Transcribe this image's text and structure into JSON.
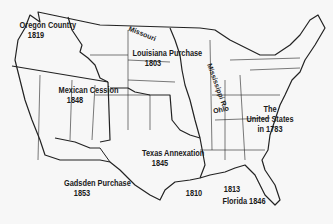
{
  "map": {
    "title": "U.S. Territorial Expansion",
    "regions": [
      {
        "id": "oregon",
        "name": "Oregon Country",
        "year": "1819"
      },
      {
        "id": "louisiana",
        "name": "Louisiana Purchase",
        "year": "1803"
      },
      {
        "id": "mexican",
        "name": "Mexican Cession",
        "year": "1848"
      },
      {
        "id": "texas",
        "name": "Texas Annexation",
        "year": "1845"
      },
      {
        "id": "gadsden",
        "name": "Gadsden Purchase",
        "year": "1853"
      },
      {
        "id": "us1783",
        "name_line1": "The",
        "name_line2": "United States",
        "year": "in 1783"
      },
      {
        "id": "wfl1810",
        "year": "1810"
      },
      {
        "id": "wfl1813",
        "year": "1813"
      },
      {
        "id": "florida",
        "name": "Florida",
        "year": "1846"
      }
    ],
    "rivers": [
      {
        "id": "missouri",
        "name": "Missouri"
      },
      {
        "id": "mississippi",
        "name": "Mississippi R."
      },
      {
        "id": "ohio",
        "name": "Ohio"
      }
    ],
    "colors": {
      "background": "#f7f7f7",
      "lines": "#1a1a1a"
    }
  }
}
